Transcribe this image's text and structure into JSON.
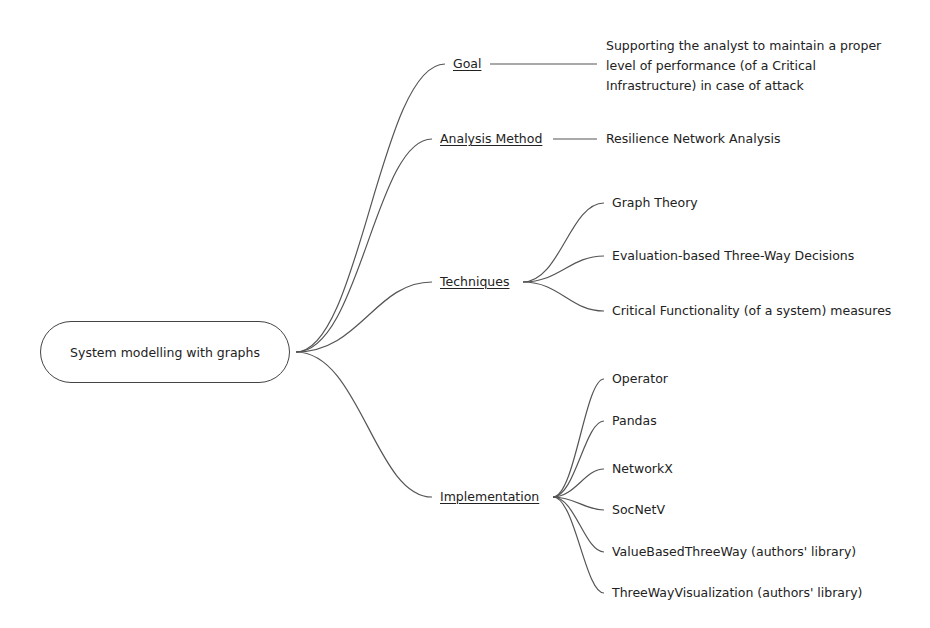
{
  "diagram": {
    "type": "mind-map",
    "root": {
      "label": "System modelling with graphs"
    },
    "branches": [
      {
        "label": "Goal",
        "children": [
          {
            "label": "Supporting the analyst to maintain a proper level of performance (of a Critical Infrastructure) in case of attack"
          }
        ]
      },
      {
        "label": "Analysis Method",
        "children": [
          {
            "label": "Resilience Network Analysis"
          }
        ]
      },
      {
        "label": "Techniques",
        "children": [
          {
            "label": "Graph Theory"
          },
          {
            "label": "Evaluation-based Three-Way Decisions"
          },
          {
            "label": "Critical Functionality (of a system) measures"
          }
        ]
      },
      {
        "label": "Implementation",
        "children": [
          {
            "label": "Operator"
          },
          {
            "label": "Pandas"
          },
          {
            "label": "NetworkX"
          },
          {
            "label": "SocNetV"
          },
          {
            "label": "ValueBasedThreeWay (authors' library)"
          },
          {
            "label": "ThreeWayVisualization (authors' library)"
          }
        ]
      }
    ],
    "colors": {
      "line": "#555555",
      "text": "#222222",
      "background": "#ffffff"
    }
  }
}
